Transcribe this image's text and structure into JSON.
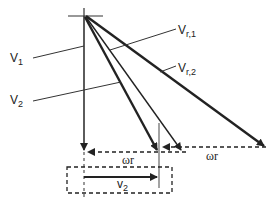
{
  "diagram": {
    "labels": {
      "v1": {
        "main": "V",
        "sub": "1"
      },
      "v2": {
        "main": "V",
        "sub": "2"
      },
      "vr1": {
        "main": "V",
        "sub": "r,1"
      },
      "vr2": {
        "main": "V",
        "sub": "r,2"
      },
      "omega_r_1": "ωr",
      "omega_r_2": "ωr",
      "v2_box": {
        "main": "v",
        "sub": "2"
      }
    },
    "colors": {
      "line": "#222222",
      "thin_line": "#333333",
      "dashed": "#222222",
      "background": "#ffffff"
    }
  }
}
